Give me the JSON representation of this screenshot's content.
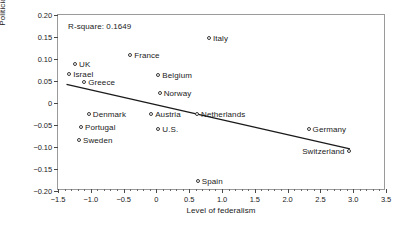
{
  "chart_data": {
    "type": "scatter",
    "title": "",
    "subtitle": "",
    "xlabel": "Level of federalism",
    "ylabel": "Politicians vs. institutions",
    "xlim": [
      -1.5,
      3.5
    ],
    "ylim": [
      -0.2,
      0.2
    ],
    "xticks": [
      -1.5,
      -1.0,
      -0.5,
      0,
      0.5,
      1.0,
      1.5,
      2.0,
      2.5,
      3.0,
      3.5
    ],
    "xtick_labels": [
      "−1.5",
      "−1.0",
      "−0.5",
      "0",
      "0.5",
      "1.0",
      "1.5",
      "2.0",
      "2.5",
      "3.0",
      "3.5"
    ],
    "yticks": [
      0.2,
      0.15,
      0.1,
      0.05,
      0,
      -0.05,
      -0.1,
      -0.15,
      -0.2
    ],
    "ytick_labels": [
      "0.20",
      "0.15",
      "0.10",
      "0.05",
      "0",
      "−0.05",
      "−0.10",
      "−0.15",
      "−0.20"
    ],
    "grid": false,
    "legend": "none",
    "annotations": [
      {
        "name": "r-square",
        "text": "R-square: 0.1649",
        "x": -1.35,
        "y": 0.185
      }
    ],
    "trendline": {
      "type": "linear",
      "x_start": -1.37,
      "y_start": 0.0425,
      "x_end": 2.95,
      "y_end": -0.1045,
      "color": "#1a1a1a"
    },
    "marker": {
      "shape": "circle-open",
      "edge_color": "#3a3a3a",
      "face_color": "#ffffff",
      "size_px": 4
    },
    "points": [
      {
        "label": "Italy",
        "x": 0.8,
        "y": 0.148,
        "label_side": "right"
      },
      {
        "label": "France",
        "x": -0.4,
        "y": 0.108,
        "label_side": "right"
      },
      {
        "label": "UK",
        "x": -1.24,
        "y": 0.088,
        "label_side": "right"
      },
      {
        "label": "Israel",
        "x": -1.33,
        "y": 0.065,
        "label_side": "right"
      },
      {
        "label": "Belgium",
        "x": 0.03,
        "y": 0.063,
        "label_side": "right"
      },
      {
        "label": "Greece",
        "x": -1.1,
        "y": 0.048,
        "label_side": "right"
      },
      {
        "label": "Norway",
        "x": 0.05,
        "y": 0.022,
        "label_side": "right"
      },
      {
        "label": "Denmark",
        "x": -1.03,
        "y": -0.025,
        "label_side": "right"
      },
      {
        "label": "Austria",
        "x": -0.08,
        "y": -0.025,
        "label_side": "right"
      },
      {
        "label": "Netherlands",
        "x": 0.62,
        "y": -0.025,
        "label_side": "right"
      },
      {
        "label": "Portugal",
        "x": -1.15,
        "y": -0.055,
        "label_side": "right"
      },
      {
        "label": "U.S.",
        "x": 0.03,
        "y": -0.06,
        "label_side": "right"
      },
      {
        "label": "Germany",
        "x": 2.32,
        "y": -0.058,
        "label_side": "right"
      },
      {
        "label": "Sweden",
        "x": -1.18,
        "y": -0.085,
        "label_side": "right"
      },
      {
        "label": "Switzerland",
        "x": 2.93,
        "y": -0.11,
        "label_side": "left"
      },
      {
        "label": "Spain",
        "x": 0.63,
        "y": -0.178,
        "label_side": "right"
      }
    ]
  }
}
